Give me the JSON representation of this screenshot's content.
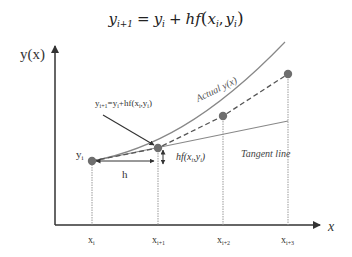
{
  "diagram": {
    "title_formula": {
      "lhs_base": "y",
      "lhs_sub": "i+1",
      "eq": "=",
      "rhs_y": "y",
      "rhs_y_sub": "i",
      "plus": "+",
      "hf": "hf",
      "open": "(",
      "x": "x",
      "x_sub": "i",
      "comma": ",",
      "y2": "y",
      "y2_sub": "i",
      "close": ")"
    },
    "y_axis_label": "y(x)",
    "x_axis_label": "x",
    "annotation_formula": "y",
    "annotation_sub": "i+1",
    "annotation_rest": "=y",
    "annotation_rest_sub": "i",
    "annotation_tail": "+hf(x",
    "annotation_tail_sub": "i",
    "annotation_comma": ",y",
    "annotation_comma_sub": "i",
    "annotation_close": ")",
    "yi_label": "y",
    "yi_sub": "i",
    "h_label": "h",
    "hf_label": "hf(x",
    "hf_sub1": "i",
    "hf_mid": ",y",
    "hf_sub2": "i",
    "hf_close": ")",
    "actual_label": "Actual y(x)",
    "tangent_label": "Tangent line",
    "x_ticks": [
      {
        "base": "x",
        "sub": "i"
      },
      {
        "base": "x",
        "sub": "i+1"
      },
      {
        "base": "x",
        "sub": "i+2"
      },
      {
        "base": "x",
        "sub": "i+3"
      }
    ],
    "colors": {
      "axis": "#333333",
      "curve": "#888888",
      "point": "#6e6e6e",
      "dashed": "#555555",
      "guide": "#999999",
      "text": "#333333"
    }
  }
}
